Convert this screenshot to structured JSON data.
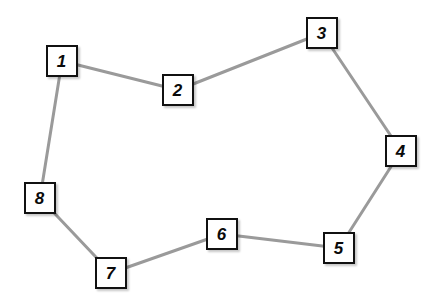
{
  "diagram": {
    "background_color": "#ffffff",
    "node_fill": "#ffffff",
    "node_border_color": "#111111",
    "edge_color": "#9a9a9a",
    "edge_width": 3,
    "node_size": 32,
    "width": 437,
    "height": 307,
    "nodes": [
      {
        "id": "1",
        "label": "1",
        "cx": 62,
        "cy": 61,
        "x": 46,
        "y": 45
      },
      {
        "id": "2",
        "label": "2",
        "cx": 178,
        "cy": 90,
        "x": 162,
        "y": 74
      },
      {
        "id": "3",
        "label": "3",
        "cx": 322,
        "cy": 33,
        "x": 306,
        "y": 17
      },
      {
        "id": "4",
        "label": "4",
        "cx": 401,
        "cy": 151,
        "x": 385,
        "y": 135
      },
      {
        "id": "5",
        "label": "5",
        "cx": 339,
        "cy": 248,
        "x": 323,
        "y": 232
      },
      {
        "id": "6",
        "label": "6",
        "cx": 222,
        "cy": 234,
        "x": 206,
        "y": 218
      },
      {
        "id": "7",
        "label": "7",
        "cx": 111,
        "cy": 273,
        "x": 95,
        "y": 257
      },
      {
        "id": "8",
        "label": "8",
        "cx": 40,
        "cy": 198,
        "x": 24,
        "y": 182
      }
    ],
    "edges": [
      {
        "from": "1",
        "to": "2"
      },
      {
        "from": "2",
        "to": "3"
      },
      {
        "from": "3",
        "to": "4"
      },
      {
        "from": "4",
        "to": "5"
      },
      {
        "from": "5",
        "to": "6"
      },
      {
        "from": "6",
        "to": "7"
      },
      {
        "from": "7",
        "to": "8"
      },
      {
        "from": "8",
        "to": "1"
      }
    ]
  }
}
